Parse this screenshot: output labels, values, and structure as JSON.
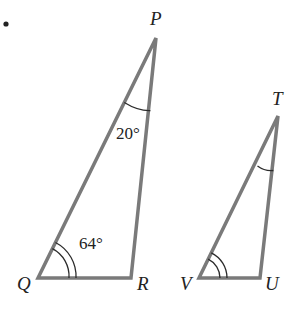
{
  "diagram": {
    "type": "similar-triangles",
    "bullet": "•",
    "triangle_pqr": {
      "vertices": {
        "P": {
          "label": "P",
          "x": 156,
          "y": 38
        },
        "Q": {
          "label": "Q",
          "x": 38,
          "y": 278
        },
        "R": {
          "label": "R",
          "x": 131,
          "y": 278
        }
      },
      "angles": {
        "P": {
          "value": "20°",
          "arcs": 1
        },
        "Q": {
          "value": "64°",
          "arcs": 2
        }
      }
    },
    "triangle_tuv": {
      "vertices": {
        "T": {
          "label": "T",
          "x": 278,
          "y": 116
        },
        "V": {
          "label": "V",
          "x": 199,
          "y": 278
        },
        "U": {
          "label": "U",
          "x": 260,
          "y": 278
        }
      },
      "angles": {
        "T": {
          "arcs": 1
        },
        "V": {
          "arcs": 2
        }
      }
    },
    "colors": {
      "edge": "#7a7a7a",
      "text": "#222222",
      "background": "#ffffff"
    }
  }
}
